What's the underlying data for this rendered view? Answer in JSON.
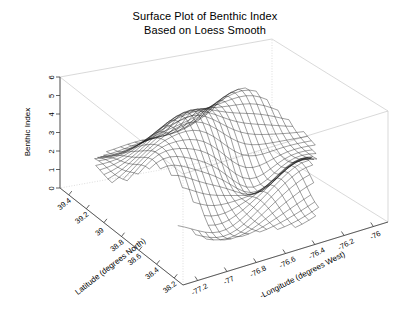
{
  "title": {
    "line1": "Surface Plot of Benthic Index",
    "line2": "Based on Loess Smooth"
  },
  "chart_data": {
    "type": "surface",
    "title": "Surface Plot of Benthic Index Based on Loess Smooth",
    "xlabel": "Latitude (degrees North)",
    "ylabel": "-Longitude (degrees West)",
    "zlabel": "Benthic Index",
    "xticks": [
      "39.4",
      "39.2",
      "39",
      "38.8",
      "38.6",
      "38.4",
      "38.2"
    ],
    "xtick_values": [
      39.4,
      39.2,
      39.0,
      38.8,
      38.6,
      38.4,
      38.2
    ],
    "yticks": [
      "-77.2",
      "-77",
      "-76.8",
      "-76.6",
      "-76.4",
      "-76.2",
      "-76"
    ],
    "ytick_values": [
      -77.2,
      -77.0,
      -76.8,
      -76.6,
      -76.4,
      -76.2,
      -76.0
    ],
    "zticks": [
      "0",
      "1",
      "2",
      "3",
      "4",
      "5",
      "6"
    ],
    "ztick_values": [
      0,
      1,
      2,
      3,
      4,
      5,
      6
    ],
    "xlim": [
      39.5,
      38.1
    ],
    "ylim": [
      -77.3,
      -75.9
    ],
    "zlim": [
      0,
      6
    ],
    "grid": false,
    "legend": "none",
    "mesh_rows": 30,
    "mesh_cols": 30,
    "surface_color": "#1a1a1a",
    "box_color": "#c8c8c8",
    "background": "#ffffff",
    "z_surface_range": [
      0.4,
      5.2
    ]
  },
  "axes": {
    "z": {
      "title": "Benthic Index",
      "ticks": [
        "0",
        "1",
        "2",
        "3",
        "4",
        "5",
        "6"
      ]
    },
    "x": {
      "title": "Latitude (degrees North)",
      "ticks": [
        "39.4",
        "39.2",
        "39",
        "38.8",
        "38.6",
        "38.4",
        "38.2"
      ]
    },
    "y": {
      "title": "-Longitude (degrees West)",
      "ticks": [
        "-77.2",
        "-77",
        "-76.8",
        "-76.6",
        "-76.4",
        "-76.2",
        "-76"
      ]
    }
  }
}
